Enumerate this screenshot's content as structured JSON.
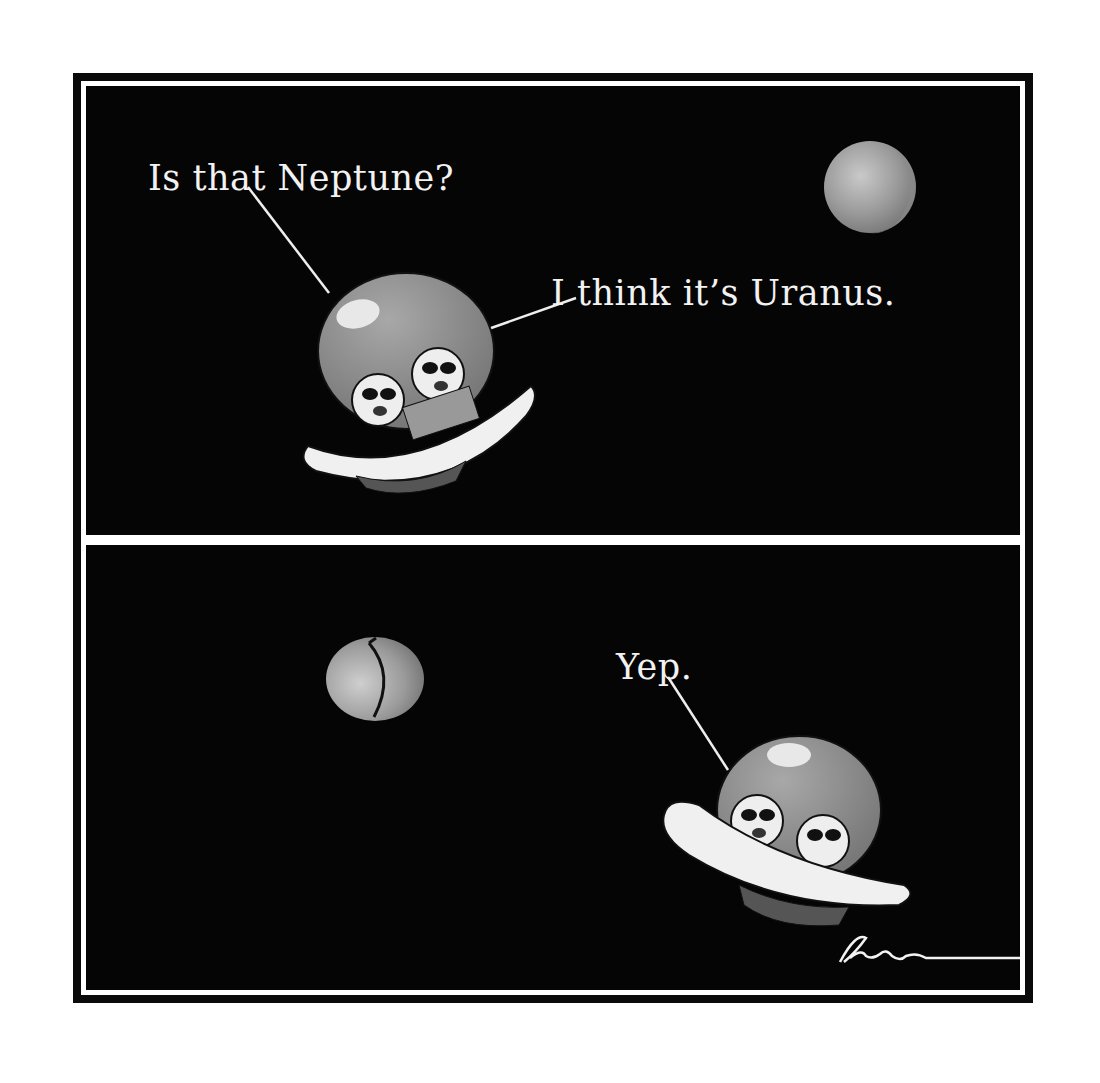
{
  "comic": {
    "panels": [
      {
        "id": "panel-1",
        "captions": [
          {
            "speaker": "left-alien",
            "text": "Is that Neptune?"
          },
          {
            "speaker": "right-alien",
            "text": "I think it’s Uranus."
          }
        ],
        "objects": [
          "ufo-with-two-aliens",
          "planet"
        ]
      },
      {
        "id": "panel-2",
        "captions": [
          {
            "speaker": "left-alien",
            "text": "Yep."
          }
        ],
        "objects": [
          "butt-shaped-planet",
          "ufo-with-two-aliens"
        ]
      }
    ],
    "signature": "Rogan",
    "colors": {
      "background": "#050505",
      "frame": "#0a0a0a",
      "text": "#f2f2f2",
      "planet": "#9a9a9a",
      "dome": "#8c8c8c",
      "saucer": "#f0f0f0"
    }
  }
}
